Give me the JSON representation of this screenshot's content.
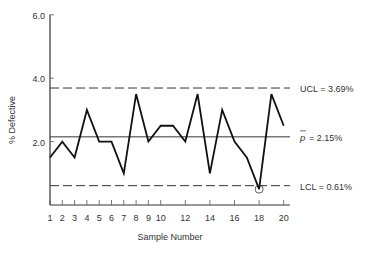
{
  "chart_data": {
    "type": "line",
    "title": "",
    "xlabel": "Sample Number",
    "ylabel": "% Defective",
    "ylim": [
      0,
      6.0
    ],
    "xlim": [
      1,
      21
    ],
    "y_ticks": [
      "2.0",
      "4.0",
      "6.0"
    ],
    "x_ticks": [
      "1",
      "2",
      "3",
      "4",
      "5",
      "6",
      "7",
      "8",
      "9",
      "10",
      "12",
      "14",
      "16",
      "18",
      "20"
    ],
    "x": [
      1,
      2,
      3,
      4,
      5,
      6,
      7,
      8,
      9,
      10,
      11,
      12,
      13,
      14,
      15,
      16,
      17,
      18,
      19,
      20
    ],
    "values": [
      1.5,
      2.0,
      1.5,
      3.0,
      2.0,
      2.0,
      1.0,
      3.5,
      2.0,
      2.5,
      2.5,
      2.0,
      3.5,
      1.0,
      3.0,
      2.0,
      1.5,
      0.5,
      3.5,
      2.5
    ],
    "reference_lines": [
      {
        "name": "UCL",
        "value": 3.69,
        "label": "UCL = 3.69%",
        "style": "dashed"
      },
      {
        "name": "p-bar",
        "value": 2.15,
        "label": "= 2.15%",
        "symbol": "p̄",
        "style": "solid"
      },
      {
        "name": "LCL",
        "value": 0.61,
        "label": "LCL = 0.61%",
        "style": "dashed"
      }
    ],
    "annotations": [
      {
        "x": 18,
        "note": "circled point below LCL"
      }
    ],
    "grid": false,
    "legend": "none"
  }
}
